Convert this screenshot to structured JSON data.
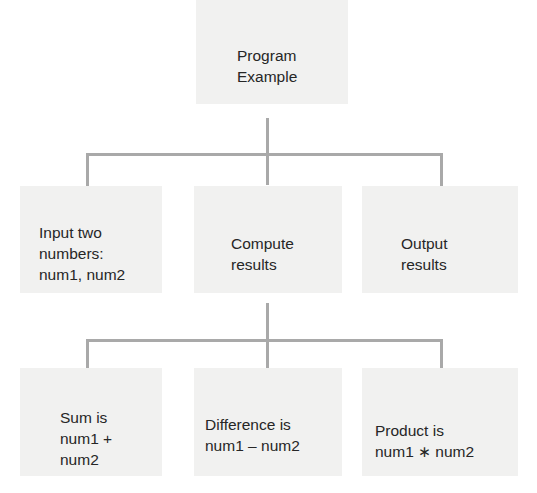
{
  "diagram": {
    "type": "hierarchy-chart",
    "connector_color": "#a9a9a9",
    "box_color": "#f1f1f0",
    "root": {
      "label": "Program\nExample"
    },
    "level1": [
      {
        "label": "Input two\nnumbers:\nnum1, num2"
      },
      {
        "label": "Compute\nresults"
      },
      {
        "label": "Output\nresults"
      }
    ],
    "level2": [
      {
        "label": "Sum is\nnum1 +\nnum2"
      },
      {
        "label": "Difference is\nnum1 – num2"
      },
      {
        "label": "Product is\nnum1 ∗ num2"
      }
    ],
    "edges": [
      {
        "from": "Program Example",
        "to": "Input two numbers: num1, num2"
      },
      {
        "from": "Program Example",
        "to": "Compute results"
      },
      {
        "from": "Program Example",
        "to": "Output results"
      },
      {
        "from": "Compute results",
        "to": "Sum is num1 + num2"
      },
      {
        "from": "Compute results",
        "to": "Difference is num1 – num2"
      },
      {
        "from": "Compute results",
        "to": "Product is num1 ∗ num2"
      }
    ]
  }
}
